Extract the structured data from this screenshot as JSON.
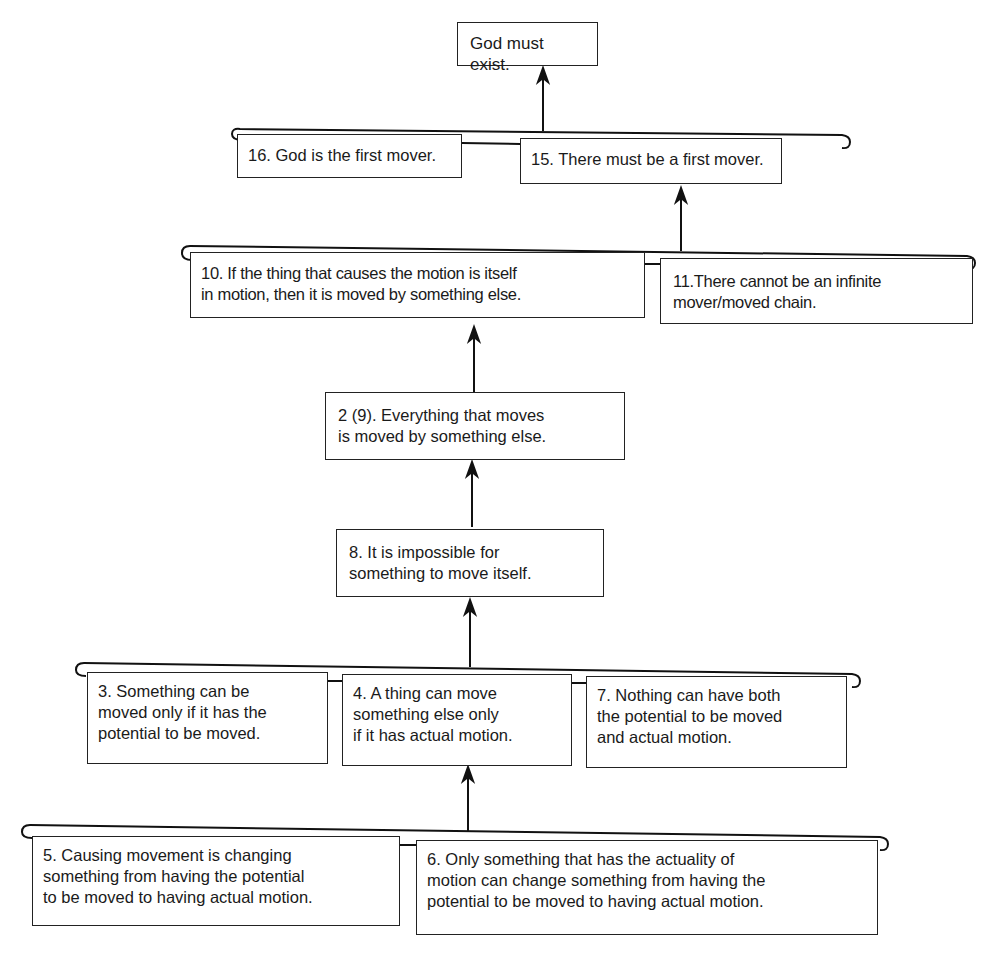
{
  "diagram": {
    "type": "argument-map",
    "nodes": {
      "conclusion": "God must exist.",
      "n16": "16. God is the first mover.",
      "n15": "15. There must be a first mover.",
      "n10": "10. If the thing that causes the motion is itself\nin motion, then it is moved by something else.",
      "n11": "11.There cannot be an infinite\nmover/moved chain.",
      "n2_9": "2 (9). Everything that moves\nis moved by something else.",
      "n8": "8. It is impossible for\nsomething to move itself.",
      "n3": "3. Something can be\nmoved only if it has the\npotential to be moved.",
      "n4": "4. A thing can move\nsomething else only\nif it has actual motion.",
      "n7": "7. Nothing can have both\nthe potential to be moved\nand actual motion.",
      "n5": "5. Causing movement is changing\nsomething from having the potential\nto be moved to having actual motion.",
      "n6": "6. Only something that has the actuality of\nmotion can change something from having the\npotential to be moved to having actual motion."
    },
    "edges": [
      {
        "from": [
          "n16",
          "n15"
        ],
        "to": "conclusion"
      },
      {
        "from": [
          "n10",
          "n11"
        ],
        "to": "n15"
      },
      {
        "from": [
          "n2_9"
        ],
        "to": "n10"
      },
      {
        "from": [
          "n8"
        ],
        "to": "n2_9"
      },
      {
        "from": [
          "n3",
          "n4",
          "n7"
        ],
        "to": "n8"
      },
      {
        "from": [
          "n5",
          "n6"
        ],
        "to": "n4"
      }
    ]
  }
}
